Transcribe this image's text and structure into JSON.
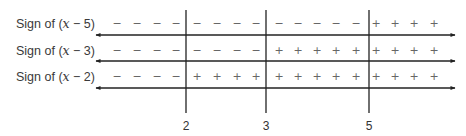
{
  "rows": [
    {
      "label_prefix": "Sign of (",
      "var": "x",
      "label_suffix": " − 5)",
      "y_text": 23,
      "y_line": 35,
      "signs": [
        "−",
        "−",
        "−",
        "−",
        "−",
        "−",
        "−",
        "−",
        "−",
        "−",
        "−",
        "−",
        "−",
        "+",
        "+",
        "+",
        "+"
      ]
    },
    {
      "label_prefix": "Sign of (",
      "var": "x",
      "label_suffix": " − 3)",
      "y_text": 50,
      "y_line": 61,
      "signs": [
        "−",
        "−",
        "−",
        "−",
        "−",
        "−",
        "−",
        "−",
        "+",
        "+",
        "+",
        "+",
        "+",
        "+",
        "+",
        "+",
        "+"
      ]
    },
    {
      "label_prefix": "Sign of (",
      "var": "x",
      "label_suffix": " − 2)",
      "y_text": 76,
      "y_line": 88,
      "signs": [
        "−",
        "−",
        "−",
        "−",
        "+",
        "+",
        "+",
        "+",
        "+",
        "+",
        "+",
        "+",
        "+",
        "+",
        "+",
        "+",
        "+"
      ]
    }
  ],
  "sign_x": [
    117,
    137,
    157,
    176,
    197,
    217,
    237,
    256,
    279,
    298,
    317,
    336,
    356,
    376,
    395,
    414,
    434
  ],
  "critical_points": [
    {
      "value": "2",
      "x": 186
    },
    {
      "value": "3",
      "x": 266
    },
    {
      "value": "5",
      "x": 369
    }
  ],
  "axis": {
    "x_start": 96,
    "x_end": 455,
    "vline_top": 10,
    "vline_bottom": 113,
    "label_y": 130
  },
  "colors": {
    "line": "#222222",
    "sign": "#666666",
    "text": "#333333"
  }
}
